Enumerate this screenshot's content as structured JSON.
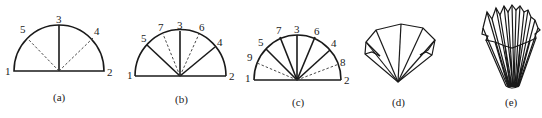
{
  "figures": [
    {
      "id": "a",
      "caption": "(a)",
      "labels": {
        "p1": "1",
        "p2": "2",
        "p3": "3",
        "p4": "4",
        "p5": "5"
      },
      "solid_folds": [
        "3"
      ],
      "dashed_folds": [
        "4",
        "5"
      ]
    },
    {
      "id": "b",
      "caption": "(b)",
      "labels": {
        "p1": "1",
        "p2": "2",
        "p3": "3",
        "p4": "4",
        "p5": "5",
        "p6": "6",
        "p7": "7"
      },
      "solid_folds": [
        "3",
        "4",
        "5"
      ],
      "dashed_folds": [
        "6",
        "7"
      ]
    },
    {
      "id": "c",
      "caption": "(c)",
      "labels": {
        "p1": "1",
        "p2": "2",
        "p3": "3",
        "p4": "4",
        "p5": "5",
        "p6": "6",
        "p7": "7",
        "p8": "8",
        "p9": "9"
      },
      "solid_folds": [
        "3",
        "4",
        "5",
        "6",
        "7"
      ],
      "dashed_folds": [
        "8",
        "9"
      ]
    },
    {
      "id": "d",
      "caption": "(d)",
      "description": "folded fan shape"
    },
    {
      "id": "e",
      "caption": "(e)",
      "description": "fully pleated filter cone"
    }
  ]
}
